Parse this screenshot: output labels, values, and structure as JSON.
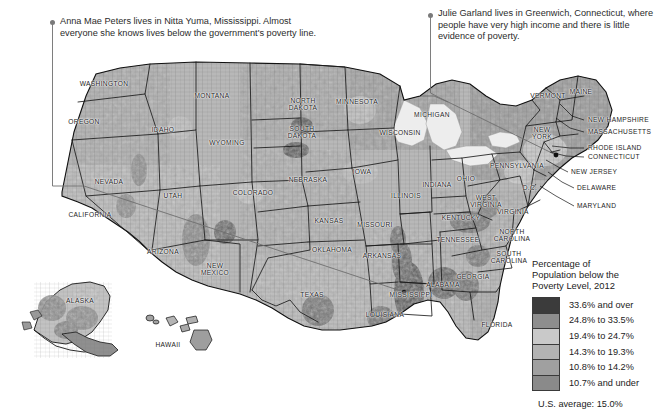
{
  "annotations": [
    {
      "id": "anna-mae-peters",
      "text": "Anna Mae Peters lives in Nitta Yuma, Mississippi. Almost everyone she knows lives below the government's poverty line."
    },
    {
      "id": "julie-garland",
      "text": "Julie Garland lives in Greenwich, Connecticut, where people have very high income and there is little evidence of poverty."
    }
  ],
  "legend": {
    "title": "Percentage of\nPopulation below the\nPoverty Level, 2012",
    "average": "U.S. average: 15.0%",
    "classes": [
      {
        "label": "33.6% and over",
        "color": "#3b3b3b"
      },
      {
        "label": "24.8% to 33.5%",
        "color": "#8e8e8e"
      },
      {
        "label": "19.4% to 24.7%",
        "color": "#c9c9c9"
      },
      {
        "label": "14.3% to 19.3%",
        "color": "#b3b3b3"
      },
      {
        "label": "10.8% to 14.2%",
        "color": "#a0a0a0"
      },
      {
        "label": "10.7% and under",
        "color": "#8a8a8a"
      }
    ]
  },
  "chart_data": {
    "type": "map",
    "title": "Percentage of Population below the Poverty Level, 2012",
    "units": "percent of population below poverty level",
    "national_average": 15.0,
    "bins": [
      {
        "label": "33.6% and over",
        "min": 33.6,
        "max": null,
        "color": "#3b3b3b"
      },
      {
        "label": "24.8% to 33.5%",
        "min": 24.8,
        "max": 33.5,
        "color": "#8e8e8e"
      },
      {
        "label": "19.4% to 24.7%",
        "min": 19.4,
        "max": 24.7,
        "color": "#c9c9c9"
      },
      {
        "label": "14.3% to 19.3%",
        "min": 14.3,
        "max": 19.3,
        "color": "#b3b3b3"
      },
      {
        "label": "10.8% to 14.2%",
        "min": 10.8,
        "max": 14.2,
        "color": "#a0a0a0"
      },
      {
        "label": "10.7% and under",
        "min": null,
        "max": 10.7,
        "color": "#8a8a8a"
      }
    ],
    "annotated_places": [
      {
        "name": "Nitta Yuma, Mississippi",
        "note": "Almost everyone she knows lives below the government's poverty line",
        "bin": "33.6% and over"
      },
      {
        "name": "Greenwich, Connecticut",
        "note": "Very high income, little evidence of poverty",
        "bin": "10.7% and under"
      }
    ]
  },
  "map": {
    "states": [
      {
        "name": "WASHINGTON",
        "x": 104,
        "y": 84
      },
      {
        "name": "OREGON",
        "x": 84,
        "y": 122
      },
      {
        "name": "IDAHO",
        "x": 163,
        "y": 130
      },
      {
        "name": "MONTANA",
        "x": 212,
        "y": 96
      },
      {
        "name": "WYOMING",
        "x": 227,
        "y": 143
      },
      {
        "name": "NEVADA",
        "x": 109,
        "y": 182
      },
      {
        "name": "UTAH",
        "x": 173,
        "y": 196
      },
      {
        "name": "CALIFORNIA",
        "x": 90,
        "y": 215
      },
      {
        "name": "ARIZONA",
        "x": 163,
        "y": 252
      },
      {
        "name": "NEW\nMEXICO",
        "x": 215,
        "y": 269
      },
      {
        "name": "COLORADO",
        "x": 253,
        "y": 193
      },
      {
        "name": "NORTH\nDAKOTA",
        "x": 303,
        "y": 104
      },
      {
        "name": "SOUTH\nDAKOTA",
        "x": 302,
        "y": 132
      },
      {
        "name": "NEBRASKA",
        "x": 308,
        "y": 180
      },
      {
        "name": "KANSAS",
        "x": 329,
        "y": 221
      },
      {
        "name": "OKLAHOMA",
        "x": 332,
        "y": 250
      },
      {
        "name": "TEXAS",
        "x": 312,
        "y": 295
      },
      {
        "name": "MINNESOTA",
        "x": 357,
        "y": 102
      },
      {
        "name": "IOWA",
        "x": 362,
        "y": 172
      },
      {
        "name": "MISSOURI",
        "x": 375,
        "y": 225
      },
      {
        "name": "ARKANSAS",
        "x": 382,
        "y": 256
      },
      {
        "name": "LOUISIANA",
        "x": 385,
        "y": 315
      },
      {
        "name": "MISSISSIPPI",
        "x": 411,
        "y": 295
      },
      {
        "name": "WISCONSIN",
        "x": 400,
        "y": 133
      },
      {
        "name": "ILLINOIS",
        "x": 406,
        "y": 196
      },
      {
        "name": "MICHIGAN",
        "x": 432,
        "y": 115
      },
      {
        "name": "INDIANA",
        "x": 437,
        "y": 185
      },
      {
        "name": "OHIO",
        "x": 466,
        "y": 179
      },
      {
        "name": "KENTUCKY",
        "x": 461,
        "y": 218
      },
      {
        "name": "TENNESSEE",
        "x": 458,
        "y": 240
      },
      {
        "name": "ALABAMA",
        "x": 443,
        "y": 285
      },
      {
        "name": "GEORGIA",
        "x": 473,
        "y": 277
      },
      {
        "name": "FLORIDA",
        "x": 497,
        "y": 325
      },
      {
        "name": "SOUTH\nCAROLINA",
        "x": 509,
        "y": 257
      },
      {
        "name": "NORTH\nCAROLINA",
        "x": 512,
        "y": 235
      },
      {
        "name": "VIRGINIA",
        "x": 513,
        "y": 212
      },
      {
        "name": "WEST\nVIRGINIA",
        "x": 486,
        "y": 201
      },
      {
        "name": "PENNSYLVANIA",
        "x": 517,
        "y": 166
      },
      {
        "name": "NEW\nYORK",
        "x": 542,
        "y": 133
      },
      {
        "name": "VERMONT",
        "x": 548,
        "y": 96
      },
      {
        "name": "MAINE",
        "x": 581,
        "y": 92
      },
      {
        "name": "D.C.",
        "x": 530,
        "y": 188
      },
      {
        "name": "HAWAII",
        "x": 168,
        "y": 345
      },
      {
        "name": "ALASKA",
        "x": 80,
        "y": 301
      }
    ],
    "leader_labels": [
      {
        "name": "NEW HAMPSHIRE",
        "x": 588,
        "y": 120
      },
      {
        "name": "MASSACHUSETTS",
        "x": 588,
        "y": 132
      },
      {
        "name": "RHODE ISLAND",
        "x": 588,
        "y": 148
      },
      {
        "name": "CONNECTICUT",
        "x": 588,
        "y": 157
      },
      {
        "name": "NEW JERSEY",
        "x": 571,
        "y": 172
      },
      {
        "name": "DELAWARE",
        "x": 577,
        "y": 188
      },
      {
        "name": "MARYLAND",
        "x": 577,
        "y": 206
      }
    ]
  }
}
